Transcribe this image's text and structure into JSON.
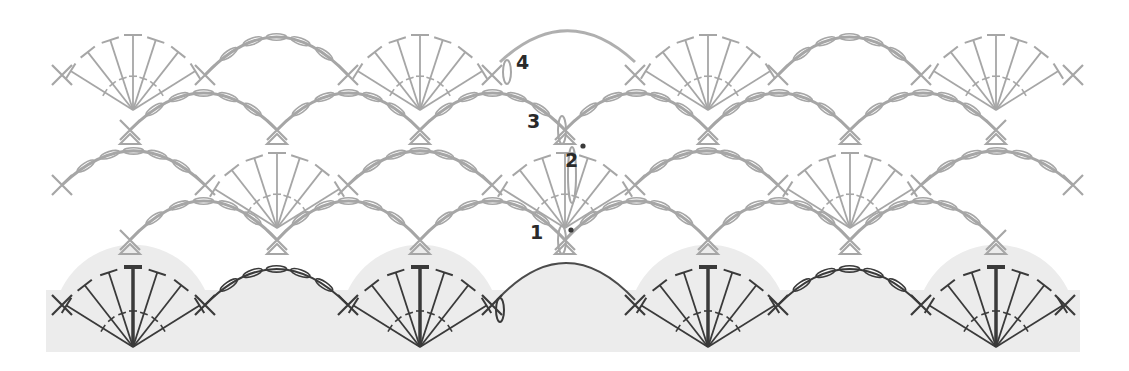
{
  "diagram": {
    "colors": {
      "background": "#ffffff",
      "base_band": "#ececec",
      "stitch_gray": "#a6a6a6",
      "stitch_dark": "#3a3a3a",
      "label": "#2a2a2a"
    },
    "row_labels": [
      {
        "text": "1",
        "x": 536,
        "y": 233
      },
      {
        "text": "2",
        "x": 571,
        "y": 161
      },
      {
        "text": "3",
        "x": 533,
        "y": 122
      },
      {
        "text": "4",
        "x": 522,
        "y": 63
      }
    ],
    "base_band": {
      "x": 46,
      "y": 290,
      "width": 1034,
      "height": 62
    },
    "rows": [
      {
        "index": 0,
        "color": "dark",
        "sc_y": 305,
        "sc_x": [
          62,
          205,
          348,
          492,
          635,
          778,
          921,
          1065
        ],
        "fans": [
          {
            "cx": 133,
            "base_y": 347,
            "radius": 80
          },
          {
            "cx": 420,
            "base_y": 347,
            "radius": 80
          },
          {
            "cx": 708,
            "base_y": 347,
            "radius": 80
          },
          {
            "cx": 996,
            "base_y": 347,
            "radius": 80
          }
        ],
        "arches": [
          {
            "x1": 205,
            "x2": 348,
            "y": 305,
            "peak": 268
          },
          {
            "x1": 778,
            "x2": 921,
            "y": 305,
            "peak": 268
          },
          {
            "x1": 497,
            "x2": 635,
            "y": 300,
            "peak": 262,
            "start": true
          }
        ]
      },
      {
        "index": 1,
        "color": "gray",
        "sc_y": 240,
        "sc_x": [
          130,
          277,
          420,
          565,
          708,
          850,
          996
        ],
        "arches": [
          {
            "x1": 130,
            "x2": 277,
            "y": 240,
            "peak": 200
          },
          {
            "x1": 277,
            "x2": 420,
            "y": 240,
            "peak": 200
          },
          {
            "x1": 420,
            "x2": 565,
            "y": 240,
            "peak": 200
          },
          {
            "x1": 565,
            "x2": 708,
            "y": 240,
            "peak": 200
          },
          {
            "x1": 708,
            "x2": 850,
            "y": 240,
            "peak": 200
          },
          {
            "x1": 850,
            "x2": 996,
            "y": 240,
            "peak": 200
          }
        ]
      },
      {
        "index": 2,
        "color": "gray",
        "sc_y": 185,
        "sc_x": [
          62,
          205,
          348,
          492,
          635,
          778,
          921,
          1073
        ],
        "fans": [
          {
            "cx": 277,
            "base_y": 228,
            "radius": 75
          },
          {
            "cx": 565,
            "base_y": 228,
            "radius": 75
          },
          {
            "cx": 850,
            "base_y": 228,
            "radius": 75
          }
        ],
        "arches": [
          {
            "x1": 62,
            "x2": 205,
            "y": 185,
            "peak": 150
          },
          {
            "x1": 348,
            "x2": 492,
            "y": 185,
            "peak": 150
          },
          {
            "x1": 635,
            "x2": 778,
            "y": 185,
            "peak": 150
          },
          {
            "x1": 921,
            "x2": 1073,
            "y": 185,
            "peak": 150
          }
        ]
      },
      {
        "index": 3,
        "color": "gray",
        "sc_y": 130,
        "sc_x": [
          130,
          277,
          420,
          565,
          708,
          850,
          996
        ],
        "arches": [
          {
            "x1": 130,
            "x2": 277,
            "y": 130,
            "peak": 92
          },
          {
            "x1": 277,
            "x2": 420,
            "y": 130,
            "peak": 92
          },
          {
            "x1": 420,
            "x2": 565,
            "y": 130,
            "peak": 92
          },
          {
            "x1": 565,
            "x2": 708,
            "y": 130,
            "peak": 92
          },
          {
            "x1": 708,
            "x2": 850,
            "y": 130,
            "peak": 92
          },
          {
            "x1": 850,
            "x2": 996,
            "y": 130,
            "peak": 92
          }
        ]
      },
      {
        "index": 4,
        "color": "gray",
        "sc_y": 75,
        "sc_x": [
          62,
          205,
          348,
          492,
          635,
          778,
          921,
          1073
        ],
        "fans": [
          {
            "cx": 133,
            "base_y": 110,
            "radius": 75
          },
          {
            "cx": 420,
            "base_y": 110,
            "radius": 75
          },
          {
            "cx": 708,
            "base_y": 110,
            "radius": 75
          },
          {
            "cx": 996,
            "base_y": 110,
            "radius": 75
          }
        ],
        "arches": [
          {
            "x1": 205,
            "x2": 348,
            "y": 75,
            "peak": 36
          },
          {
            "x1": 778,
            "x2": 921,
            "y": 75,
            "peak": 36
          },
          {
            "x1": 500,
            "x2": 635,
            "y": 62,
            "peak": 30,
            "start": true
          }
        ]
      }
    ],
    "markers": {
      "ovals": [
        {
          "cx": 500,
          "cy": 310,
          "rx": 4,
          "ry": 12,
          "color": "dark"
        },
        {
          "cx": 562,
          "cy": 240,
          "rx": 4,
          "ry": 14,
          "color": "gray"
        },
        {
          "cx": 572,
          "cy": 175,
          "rx": 4,
          "ry": 28,
          "color": "gray"
        },
        {
          "cx": 562,
          "cy": 130,
          "rx": 4,
          "ry": 14,
          "color": "gray"
        },
        {
          "cx": 507,
          "cy": 72,
          "rx": 4,
          "ry": 12,
          "color": "gray"
        }
      ],
      "dots": [
        {
          "cx": 571,
          "cy": 230
        },
        {
          "cx": 583,
          "cy": 146
        }
      ]
    },
    "legend_symbols": {
      "single_crochet": "X",
      "chain": "oval",
      "double_crochet": "T with bar",
      "slip_stitch": "dot",
      "increase": "triangle"
    }
  }
}
